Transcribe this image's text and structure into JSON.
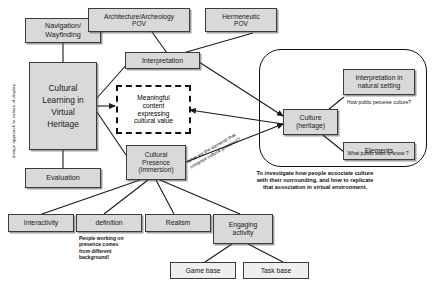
{
  "diagram": {
    "colors": {
      "box_fill": "#d9d9d9",
      "box_border": "#3c3c3c",
      "dashed_border": "#111111",
      "line": "#1a1a1a",
      "background": "#ffffff"
    },
    "vertical_label": "design approach to culture of display",
    "nodes": {
      "navigation_wayfinding": "Navigation/\nWayfinding",
      "navigation_wayfinding_l1": "Navigation/",
      "navigation_wayfinding_l2": "Wayfinding",
      "cultural_learning_l1": "Cultural",
      "cultural_learning_l2": "Learning in",
      "cultural_learning_l3": "Virtual",
      "cultural_learning_l4": "Heritage",
      "evaluation": "Evaluation",
      "architecture_pov_l1": "Architecture/Archeology",
      "architecture_pov_l2": "POV",
      "hermeneutic_pov_l1": "Hermeneutic",
      "hermeneutic_pov_l2": "POV",
      "interpretation": "Interpretation",
      "meaningful_l1": "Meaningful",
      "meaningful_l2": "content",
      "meaningful_l3": "expressing",
      "meaningful_l4": "cultural value",
      "cultural_presence_l1": "Cultural",
      "cultural_presence_l2": "Presence",
      "cultural_presence_l3": "(Immersion)",
      "culture_heritage_l1": "Culture",
      "culture_heritage_l2": "(heritage)",
      "interpretation_natural_l1": "Interpretation in",
      "interpretation_natural_l2": "natural setting",
      "elements": "Elements",
      "interactivity": "Interactivity",
      "definition": "definition",
      "realism": "Realism",
      "engaging_activity_l1": "Engaging",
      "engaging_activity_l2": "activity",
      "game_base": "Game base",
      "task_base": "Task  base"
    },
    "notes": {
      "how_public_perceive": "How public perceive culture?",
      "what_public_want": "What public want to know ?",
      "investigate_l1": "To investigate how people associate culture",
      "investigate_l2": "with their surrounding, and how to replicate",
      "investigate_l3": "that association in virtual environment.",
      "presence_background_l1": "People working on",
      "presence_background_l2": "presence comes",
      "presence_background_l3": "from different",
      "presence_background_l4": "background!",
      "elements_question_l1": "What are the elements that",
      "elements_question_l2": "compose cultural presence?"
    }
  }
}
